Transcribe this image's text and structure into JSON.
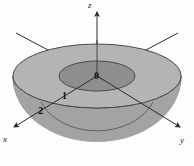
{
  "figure": {
    "background_color": "#fdfdfd",
    "axes": [
      {
        "name": "z-axis",
        "label": "z",
        "direction": "up",
        "arrow": true
      },
      {
        "name": "x-axis",
        "label": "x",
        "direction": "down-left",
        "arrow": true
      },
      {
        "name": "y-axis",
        "label": "y",
        "direction": "down-right",
        "arrow": true
      }
    ],
    "labels": {
      "z": "z",
      "x": "x",
      "y": "y",
      "origin": "0",
      "inner_radius": "1",
      "outer_radius": "2"
    },
    "colors": {
      "outer_top_ring": "#b4b4b4",
      "inner_top_disc": "#8f8f8f",
      "bowl_body": "#969696",
      "side_band": "#a6a6a6",
      "outline": "#4a4a4a",
      "axis_line": "#2b2b2b",
      "text": "#111111"
    },
    "geometry": {
      "origin_px": {
        "x": 97,
        "y": 76
      },
      "outer_ellipse_rx": 84,
      "outer_ellipse_ry": 32,
      "inner_ellipse_rx": 38,
      "inner_ellipse_ry": 15,
      "band_height_px": 22,
      "bowl_depth_px": 64
    }
  }
}
